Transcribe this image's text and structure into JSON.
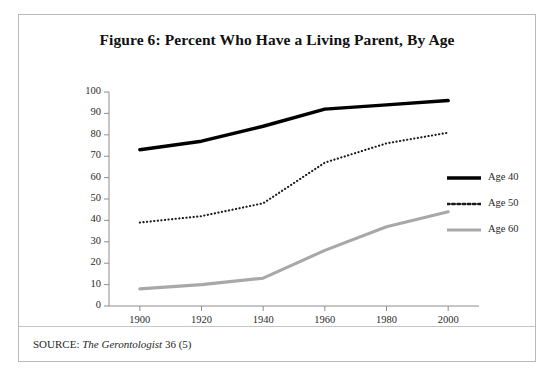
{
  "figure": {
    "title": "Figure 6: Percent Who Have a Living Parent, By Age",
    "source_prefix": "SOURCE:",
    "source_journal": "The Gerontologist",
    "source_volume": "36 (5)"
  },
  "legend": {
    "items": [
      {
        "label": "Age 40",
        "style": "solid-thick",
        "color": "#000000"
      },
      {
        "label": "Age 50",
        "style": "dotted",
        "color": "#1a1a1a"
      },
      {
        "label": "Age 60",
        "style": "solid",
        "color": "#a8a8a8"
      }
    ]
  },
  "chart_data": {
    "type": "line",
    "title": "Figure 6: Percent Who Have a Living Parent, By Age",
    "xlabel": "",
    "ylabel": "",
    "x": [
      1900,
      1920,
      1940,
      1960,
      1980,
      2000
    ],
    "categories": [
      "1900",
      "1920",
      "1940",
      "1960",
      "1980",
      "2000"
    ],
    "xlim": [
      1890,
      2010
    ],
    "ylim": [
      0,
      100
    ],
    "y_ticks": [
      0,
      10,
      20,
      30,
      40,
      50,
      60,
      70,
      80,
      90,
      100
    ],
    "x_ticks": [
      1900,
      1920,
      1940,
      1960,
      1980,
      2000
    ],
    "grid": false,
    "legend_position": "right",
    "series": [
      {
        "name": "Age 40",
        "color": "#000000",
        "style": "solid-thick",
        "values": [
          73,
          77,
          84,
          92,
          94,
          96
        ]
      },
      {
        "name": "Age 50",
        "color": "#1a1a1a",
        "style": "dotted",
        "values": [
          39,
          42,
          48,
          67,
          76,
          81
        ]
      },
      {
        "name": "Age 60",
        "color": "#a8a8a8",
        "style": "solid",
        "values": [
          8,
          10,
          13,
          26,
          37,
          44
        ]
      }
    ]
  }
}
